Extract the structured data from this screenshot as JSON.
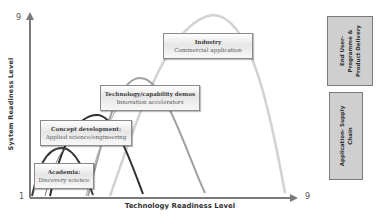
{
  "axes": {
    "y_label": "System Readiness Level",
    "x_label": "Technology Readiness Level",
    "y_min_tick": "1",
    "y_max_tick": "9",
    "x_max_tick": "9"
  },
  "stages": [
    {
      "title": "Academia:",
      "subtitle": "Discovery science",
      "arc_color": "#3a3a3a"
    },
    {
      "title": "Concept development:",
      "subtitle": "Applied science/engineering",
      "arc_color": "#2f2f2f"
    },
    {
      "title": "Technology/capability demos",
      "subtitle": "Innovation accelerators",
      "arc_color": "#9a9a9a"
    },
    {
      "title": "Industry",
      "subtitle": "Commercial application",
      "arc_color": "#cfcfcf"
    }
  ],
  "side_boxes": [
    {
      "lines": [
        "End User-",
        "Programme &",
        "Product Delivery"
      ]
    },
    {
      "lines": [
        "Application- Supply",
        "Chain"
      ]
    }
  ],
  "colors": {
    "axis": "#7a7a7a",
    "box_border": "#8a8a8a",
    "side_box_fill": "#cfcfcf"
  }
}
